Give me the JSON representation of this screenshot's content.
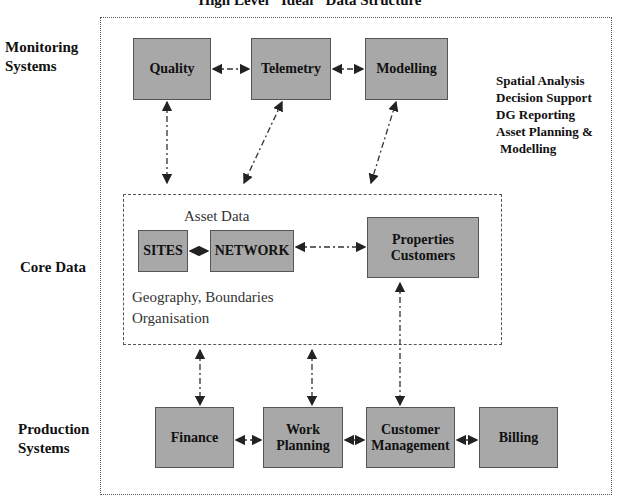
{
  "title": "High Level \"Ideal\" Data Structure",
  "layers": {
    "monitoring": "Monitoring Systems",
    "core": "Core Data",
    "production": "Production Systems"
  },
  "monitoring_boxes": [
    "Quality",
    "Telemetry",
    "Modelling"
  ],
  "notes": [
    "Spatial Analysis",
    "Decision Support",
    "DG Reporting",
    "Asset Planning &",
    "Modelling"
  ],
  "core": {
    "label": "Asset Data",
    "sites": "SITES",
    "network": "NETWORK",
    "properties": "Properties Customers",
    "geo": "Geography, Boundaries",
    "org": "Organisation"
  },
  "production_boxes": [
    "Finance",
    "Work Planning",
    "Customer Management",
    "Billing"
  ]
}
